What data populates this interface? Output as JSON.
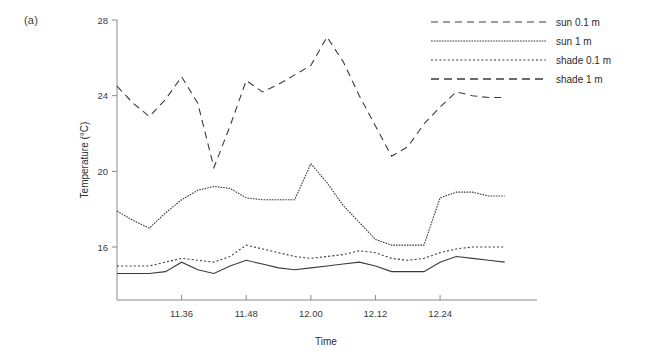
{
  "panel": {
    "label": "(a)"
  },
  "chart_data": {
    "type": "line",
    "title": "",
    "xlabel": "Time",
    "ylabel": "Temperature (°C)",
    "ylim": [
      13.2,
      28
    ],
    "yticks": [
      16,
      20,
      24,
      28
    ],
    "ytick_labels": [
      "16",
      "20",
      "24",
      "28"
    ],
    "xlim": [
      0,
      26
    ],
    "xticks": [
      4,
      8,
      12,
      16,
      20
    ],
    "xtick_labels": [
      "11.36",
      "11.48",
      "12.00",
      "12.12",
      "12.24"
    ],
    "grid": false,
    "legend_position": "top-right",
    "x": [
      0,
      1,
      2,
      3,
      4,
      5,
      6,
      7,
      8,
      9,
      10,
      11,
      12,
      13,
      14,
      15,
      16,
      17,
      18,
      19,
      20,
      21,
      22,
      23,
      24
    ],
    "series": [
      {
        "name": "sun 0.1 m",
        "style": "dashed",
        "values": [
          24.5,
          23.6,
          22.9,
          23.8,
          25.0,
          23.6,
          20.2,
          22.4,
          24.8,
          24.2,
          24.6,
          25.1,
          25.6,
          27.1,
          25.8,
          24.0,
          22.4,
          20.8,
          21.3,
          22.5,
          23.4,
          24.2,
          24.0,
          23.9,
          23.9
        ]
      },
      {
        "name": "sun 1 m",
        "style": "fine-dotted",
        "values": [
          17.9,
          17.4,
          17.0,
          17.8,
          18.5,
          19.0,
          19.2,
          19.1,
          18.6,
          18.5,
          18.5,
          18.5,
          20.4,
          19.4,
          18.2,
          17.3,
          16.4,
          16.1,
          16.1,
          16.1,
          18.6,
          18.9,
          18.9,
          18.7,
          18.7
        ]
      },
      {
        "name": "shade 0.1 m",
        "style": "dotted",
        "values": [
          15.0,
          15.0,
          15.0,
          15.2,
          15.4,
          15.3,
          15.2,
          15.5,
          16.1,
          15.9,
          15.7,
          15.5,
          15.4,
          15.5,
          15.6,
          15.8,
          15.7,
          15.4,
          15.3,
          15.4,
          15.7,
          15.9,
          16.0,
          16.0,
          16.0
        ]
      },
      {
        "name": "shade 1 m",
        "style": "solid-dense",
        "values": [
          14.6,
          14.6,
          14.6,
          14.7,
          15.2,
          14.8,
          14.6,
          15.0,
          15.3,
          15.1,
          14.9,
          14.8,
          14.9,
          15.0,
          15.1,
          15.2,
          15.0,
          14.7,
          14.7,
          14.7,
          15.2,
          15.5,
          15.4,
          15.3,
          15.2
        ]
      }
    ],
    "legend": [
      {
        "label": "sun 0.1 m",
        "style": "dashed"
      },
      {
        "label": "sun 1 m",
        "style": "fine-dotted"
      },
      {
        "label": "shade 0.1 m",
        "style": "dotted"
      },
      {
        "label": "shade 1 m",
        "style": "dashed-wide"
      }
    ],
    "colors": {
      "line": "#3b3b3b",
      "axis": "#8a8a8a",
      "text": "#2e2e2e"
    }
  }
}
